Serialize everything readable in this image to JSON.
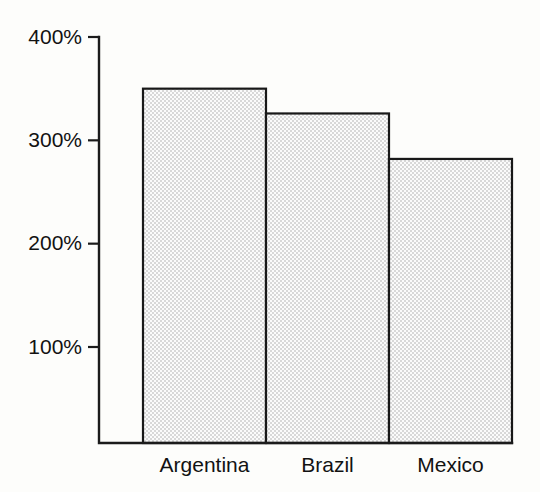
{
  "chart_data": {
    "type": "bar",
    "title": "",
    "subtitle": "",
    "xlabel": "",
    "ylabel": "",
    "categories": [
      "Argentina",
      "Brazil",
      "Mexico"
    ],
    "values": [
      350,
      326,
      282
    ],
    "value_suffix": "%",
    "ylim": [
      0,
      400
    ],
    "yticks": [
      100,
      200,
      300,
      400
    ],
    "ytick_labels": [
      "100%",
      "200%",
      "300%",
      "400%"
    ],
    "grid": false,
    "legend": null,
    "bar_style": {
      "fill": "halftone-dot-gray",
      "fill_color": "#e9e9e9",
      "edge_color": "#181818",
      "bars_adjacent": true
    },
    "axis_style": {
      "axis_color": "#1b1b1b",
      "tick_direction": "outward",
      "spines": [
        "left",
        "bottom"
      ]
    },
    "background_color": "#fdfdfb"
  },
  "axis": {
    "y_ticks": [
      {
        "label": "400%",
        "value": 400
      },
      {
        "label": "300%",
        "value": 300
      },
      {
        "label": "200%",
        "value": 200
      },
      {
        "label": "100%",
        "value": 100
      }
    ]
  },
  "bars": [
    {
      "label": "Argentina",
      "value": 350,
      "display": "350%"
    },
    {
      "label": "Brazil",
      "value": 326,
      "display": "326%"
    },
    {
      "label": "Mexico",
      "value": 282,
      "display": "282%"
    }
  ]
}
